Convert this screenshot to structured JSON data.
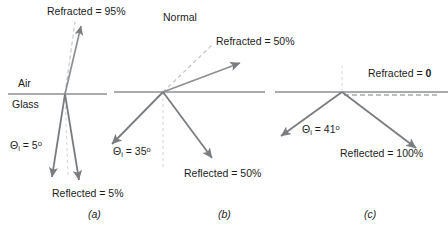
{
  "figure": {
    "title": "",
    "media_labels": {
      "upper_medium": "Air",
      "lower_medium": "Glass"
    },
    "normal_label": "Normal",
    "colors": {
      "interface_line": "#55585a",
      "ray": "#7a7d80",
      "incident_ray": "#7a7d80",
      "dashed_normal": "#b9bcbe",
      "text": "#1d1d1d",
      "background": "#ffffff"
    },
    "panels": [
      {
        "key": "(a)",
        "incident_angle_symbol": "Θ",
        "incident_angle_subscript": "i",
        "incident_angle_value": "5",
        "incident_angle_unit": "o",
        "incident_angle_text": "Θi = 5o",
        "refracted_label": "Refracted = 95%",
        "refracted_value": 95,
        "reflected_label": "Reflected = 5%",
        "reflected_value": 5
      },
      {
        "key": "(b)",
        "incident_angle_symbol": "Θ",
        "incident_angle_subscript": "i",
        "incident_angle_value": "35",
        "incident_angle_unit": "o",
        "incident_angle_text": "Θi = 35o",
        "refracted_label": "Refracted = 50%",
        "refracted_value": 50,
        "reflected_label": "Reflected = 50%",
        "reflected_value": 50
      },
      {
        "key": "(c)",
        "incident_angle_symbol": "Θ",
        "incident_angle_subscript": "i",
        "incident_angle_value": "41",
        "incident_angle_unit": "o",
        "incident_angle_text": "Θi = 41o",
        "refracted_label_prefix": "Refracted = ",
        "refracted_label_value": "0",
        "refracted_value": 0,
        "reflected_label": "Reflected = 100%",
        "reflected_value": 100
      }
    ]
  }
}
